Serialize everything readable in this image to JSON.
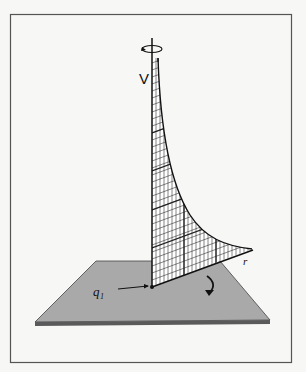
{
  "figure": {
    "labels": {
      "vertical_axis": "V",
      "charge": "q₁",
      "radial_axis": "r"
    },
    "icons": {
      "rotation_top": "rotation-arrow-icon",
      "rotation_base": "curved-arrow-icon"
    },
    "colors": {
      "background": "#f7f7f5",
      "frame": "#555555",
      "plane": "#a9a9a9",
      "plane_edge": "#3a3a3a",
      "ink": "#111111",
      "mesh": "#222222"
    }
  }
}
